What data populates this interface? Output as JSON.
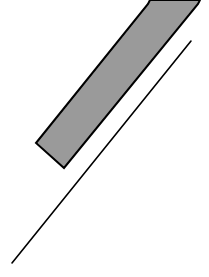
{
  "diagram": {
    "background": "#ffffff",
    "shapes": [
      {
        "type": "polygon",
        "name": "gray-slanted-bar",
        "fill": "#9a9a9a",
        "stroke": "#000000",
        "stroke_width": 2,
        "points": "150,0 200,0 198,4 64,168 36,143 148,4"
      },
      {
        "type": "line",
        "name": "diagonal-line",
        "stroke": "#000000",
        "stroke_width": 1.6,
        "x1": 191,
        "y1": 41,
        "x2": 12,
        "y2": 263
      }
    ]
  }
}
